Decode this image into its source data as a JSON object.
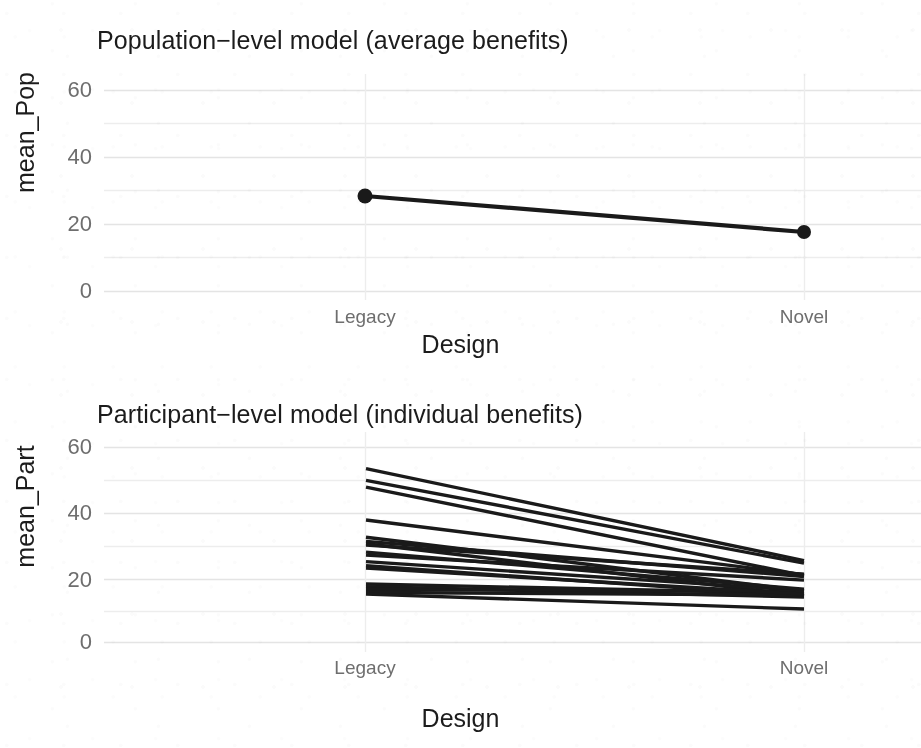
{
  "figure": {
    "background_color": "#ffffff",
    "grid_color": "#e9e9e9",
    "line_color": "#1a1a1a",
    "axis_text_color": "#6e6e6e",
    "axis_title_color": "#1c1c1c",
    "badge_border_color": "#8d8d8d",
    "badge_text_color": "#7a7a7a"
  },
  "chart_data": [
    {
      "type": "line",
      "panel": "top",
      "title": "Population−level model (average benefits)",
      "xlabel": "Design",
      "ylabel": "mean_Pop",
      "categories": [
        "Legacy",
        "Novel"
      ],
      "values": [
        28.3,
        17.6
      ],
      "ylim": [
        0,
        62
      ],
      "yticks": [
        0,
        20,
        40,
        60
      ],
      "ytick_labels": [
        "0",
        "20",
        "40",
        "60"
      ],
      "minor_gridlines": [
        10,
        30,
        50
      ],
      "grid": true,
      "legend": "none",
      "markers": true,
      "series": [
        {
          "name": "population mean",
          "values": [
            28.3,
            17.6
          ]
        }
      ]
    },
    {
      "type": "line",
      "panel": "bottom",
      "title": "Participant−level model (individual benefits)",
      "xlabel": "Design",
      "ylabel": "mean_Part",
      "categories": [
        "Legacy",
        "Novel"
      ],
      "ylim": [
        0,
        62
      ],
      "yticks": [
        0,
        20,
        40,
        60
      ],
      "ytick_labels": [
        "0",
        "20",
        "40",
        "60"
      ],
      "minor_gridlines": [
        10,
        30,
        50
      ],
      "grid": true,
      "legend": "none",
      "markers": false,
      "series": [
        {
          "name": "4",
          "values": [
            53.5,
            25.2
          ]
        },
        {
          "name": "9",
          "values": [
            49.9,
            24.4
          ]
        },
        {
          "name": "12",
          "values": [
            47.8,
            20.6
          ]
        },
        {
          "name": "8",
          "values": [
            37.7,
            20.9
          ]
        },
        {
          "name": "1",
          "values": [
            32.4,
            15.9
          ]
        },
        {
          "name": "2",
          "values": [
            31.1,
            20.3
          ]
        },
        {
          "name": "3",
          "values": [
            30.4,
            14.4
          ]
        },
        {
          "name": "5",
          "values": [
            26.9,
            19.2
          ]
        },
        {
          "name": "6",
          "values": [
            24.9,
            16.0
          ]
        },
        {
          "name": "7",
          "values": [
            23.6,
            14.2
          ]
        },
        {
          "name": "10",
          "values": [
            18.0,
            15.1
          ]
        },
        {
          "name": "11",
          "values": [
            17.2,
            14.0
          ]
        },
        {
          "name": "13",
          "values": [
            16.3,
            15.7
          ]
        },
        {
          "name": "14",
          "values": [
            15.4,
            14.6
          ]
        },
        {
          "name": "15",
          "values": [
            14.9,
            10.3
          ]
        },
        {
          "name": "16",
          "values": [
            30.0,
            21.0
          ]
        },
        {
          "name": "17",
          "values": [
            27.8,
            16.4
          ]
        },
        {
          "name": "18",
          "values": [
            22.9,
            14.9
          ]
        }
      ],
      "point_labels": [
        {
          "text": "4",
          "x_px": 339,
          "y_px": 462
        },
        {
          "text": "9",
          "x_px": 398,
          "y_px": 478
        },
        {
          "text": "8",
          "x_px": 338,
          "y_px": 519
        }
      ]
    }
  ]
}
